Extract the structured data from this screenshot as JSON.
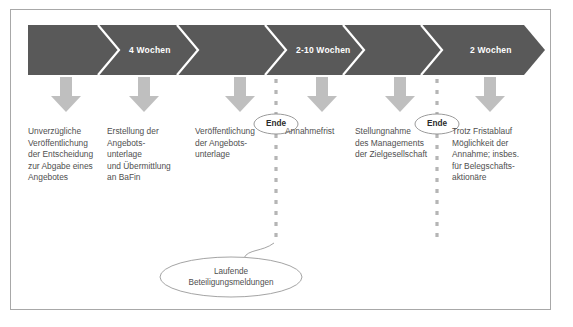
{
  "diagram": {
    "title_semantic": "takeover-offer-timeline",
    "colors": {
      "band": "#595959",
      "band_text": "#ffffff",
      "arrow": "#bfbfbf",
      "body_text": "#4f4f4f",
      "frame_border": "#a8a8a8",
      "dashed_line": "#b5b5b5",
      "ellipse_stroke": "#9a9a9a",
      "ende_text": "#2b2b2b",
      "background": "#ffffff"
    },
    "band": {
      "name": "timeline-chevron-band",
      "segments": [
        {
          "label": "",
          "name": "segment-start"
        },
        {
          "label": "4 Wochen",
          "name": "segment-4-wochen"
        },
        {
          "label": "",
          "name": "segment-blank-2"
        },
        {
          "label": "",
          "name": "segment-blank-3"
        },
        {
          "label": "2-10 Wochen",
          "name": "segment-2-10-wochen"
        },
        {
          "label": "",
          "name": "segment-blank-5"
        },
        {
          "label": "2 Wochen",
          "name": "segment-2-wochen"
        }
      ]
    },
    "columns": [
      {
        "name": "column-unverzuegliche-veroeffentlichung",
        "arrow_x": 66,
        "text_x": 28,
        "width": 80,
        "lines": [
          "Unverzügliche",
          "Veröffentlichung",
          "der Entscheidung",
          "zur Abgabe eines",
          "Angebotes"
        ]
      },
      {
        "name": "column-erstellung-angebotsunterlage",
        "arrow_x": 144,
        "text_x": 107,
        "width": 86,
        "lines": [
          "Erstellung der",
          "Angebots-",
          "unterlage",
          "und Übermittlung",
          "an BaFin"
        ]
      },
      {
        "name": "column-veroeffentlichung-angebotsunterlage",
        "arrow_x": 240,
        "text_x": 195,
        "width": 72,
        "lines": [
          "Veröffentlichung",
          "der Angebots-",
          "unterlage"
        ]
      },
      {
        "name": "column-annahmefrist",
        "arrow_x": 322,
        "text_x": 277,
        "width": 72,
        "lines": [
          "Annahmefrist"
        ]
      },
      {
        "name": "column-stellungnahme-management",
        "arrow_x": 400,
        "text_x": 355,
        "width": 90,
        "lines": [
          "Stellungnahme",
          "des Managements",
          "der Zielgesellschaft"
        ]
      },
      {
        "name": "column-trotz-fristablauf",
        "arrow_x": 490,
        "text_x": 452,
        "width": 92,
        "lines": [
          "Trotz Fristablauf",
          "Möglichkeit der",
          "Annahme; insbes.",
          "für Belegschafts-",
          "aktionäre"
        ]
      }
    ],
    "ende_markers": [
      {
        "name": "ende-marker-1",
        "label": "Ende",
        "x": 276,
        "y": 124
      },
      {
        "name": "ende-marker-2",
        "label": "Ende",
        "x": 437,
        "y": 124
      }
    ],
    "callout": {
      "name": "callout-laufende-beteiligungsmeldungen",
      "lines": [
        "Laufende",
        "Beteiligungsmeldungen"
      ],
      "cx": 231,
      "cy": 277
    }
  }
}
